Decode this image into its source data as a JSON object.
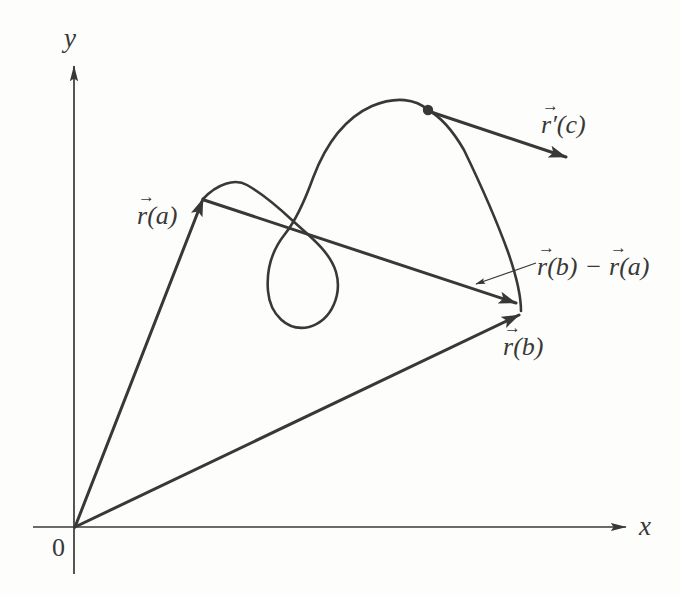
{
  "colors": {
    "ink": "#383838",
    "paper": "#fdfdfb"
  },
  "axes": {
    "y_label": "y",
    "x_label": "x",
    "origin_label": "0"
  },
  "labels": {
    "arrow_glyph": "→",
    "r_a": {
      "base": "r",
      "rest": "(a)"
    },
    "r_b": {
      "base": "r",
      "rest": "(b)"
    },
    "r_prime_c": {
      "base": "r",
      "rest": "′(c)"
    },
    "difference": {
      "base1": "r",
      "rest1": "(b)",
      "op": "−",
      "base2": "r",
      "rest2": "(a)"
    }
  }
}
